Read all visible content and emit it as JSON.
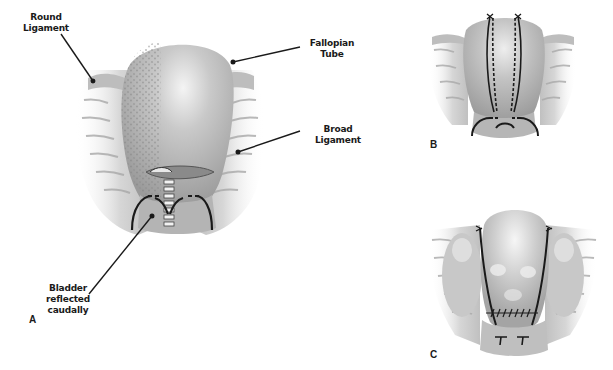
{
  "figure": {
    "panels": [
      {
        "id": "A",
        "label": "A"
      },
      {
        "id": "B",
        "label": "B"
      },
      {
        "id": "C",
        "label": "C"
      }
    ],
    "annotations": {
      "round_ligament": "Round\nLigament",
      "fallopian_tube": "Fallopian\nTube",
      "broad_ligament": "Broad\nLigament",
      "bladder": "Bladder\nreflected\ncaudally"
    },
    "colors": {
      "background": "#ffffff",
      "tissue_light": "#dcdcdc",
      "tissue_mid": "#b8b8b8",
      "tissue_dark": "#8c8c8c",
      "suture": "#1a1a1a",
      "text": "#1a1a1a"
    }
  }
}
